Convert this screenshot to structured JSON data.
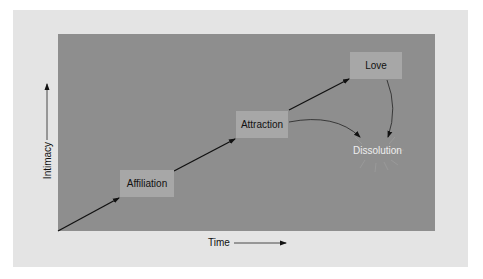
{
  "diagram": {
    "nodes": [
      {
        "id": "affiliation",
        "label": "Affiliation"
      },
      {
        "id": "attraction",
        "label": "Attraction"
      },
      {
        "id": "love",
        "label": "Love"
      },
      {
        "id": "dissolution",
        "label": "Dissolution"
      }
    ],
    "edges": [
      {
        "from": "origin",
        "to": "affiliation"
      },
      {
        "from": "affiliation",
        "to": "attraction"
      },
      {
        "from": "attraction",
        "to": "love"
      },
      {
        "from": "attraction",
        "to": "dissolution"
      },
      {
        "from": "love",
        "to": "dissolution"
      }
    ],
    "axes": {
      "x_label": "Time",
      "y_label": "Intimacy"
    },
    "colors": {
      "outer_panel": "#e4e4e4",
      "inner_panel": "#8e8e8e",
      "node_box": "#a7a7a7",
      "dissolution_text": "#eeeeee"
    }
  }
}
